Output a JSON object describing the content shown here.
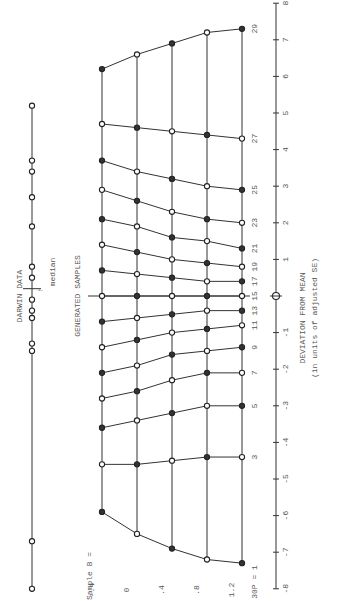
{
  "chart_data": {
    "type": "line",
    "orientation": "rotated-90-clockwise",
    "title_darwin": "DARWIN DATA",
    "title_generated": "GENERATED SAMPLES",
    "median_label": "median",
    "median_arrow": "↑",
    "xlabel_line1": "DEVIATION FROM MEAN",
    "xlabel_line2": "(in units of adjusted SE)",
    "xlim": [
      -8,
      8
    ],
    "x_ticks": [
      "-8",
      "-7",
      "-6",
      "-5",
      "-4",
      "-3",
      "-2",
      "-1",
      "0",
      "1",
      "2",
      "3",
      "4",
      "5",
      "6",
      "7",
      "8"
    ],
    "sample_b_title": "Sample B =",
    "sample_b_values": [
      "-.4",
      "0",
      ".4",
      ".8",
      "1.2"
    ],
    "p_label_prefix": "30P = ",
    "p_values": [
      1,
      3,
      5,
      7,
      9,
      11,
      13,
      15,
      17,
      19,
      21,
      23,
      25,
      27,
      29
    ],
    "darwin_points": [
      -8.0,
      -6.7,
      -1.5,
      -1.3,
      -0.6,
      -0.4,
      -0.1,
      0.5,
      0.8,
      1.9,
      2.7,
      3.4,
      3.7,
      5.2
    ],
    "darwin_median": 0.2,
    "series": [
      {
        "name": "B = -.4",
        "values": [
          -5.9,
          -4.6,
          -3.6,
          -2.8,
          -2.1,
          -1.4,
          -0.7,
          0.0,
          0.7,
          1.4,
          2.1,
          2.9,
          3.7,
          4.7,
          6.2
        ]
      },
      {
        "name": "B = 0",
        "values": [
          -6.5,
          -4.6,
          -3.4,
          -2.6,
          -1.9,
          -1.2,
          -0.6,
          0.0,
          0.6,
          1.2,
          1.9,
          2.6,
          3.4,
          4.6,
          6.6
        ]
      },
      {
        "name": "B = .4",
        "values": [
          -6.9,
          -4.5,
          -3.2,
          -2.3,
          -1.6,
          -1.0,
          -0.5,
          0.0,
          0.5,
          1.0,
          1.6,
          2.3,
          3.2,
          4.5,
          6.9
        ]
      },
      {
        "name": "B = .8",
        "values": [
          -7.2,
          -4.4,
          -3.0,
          -2.1,
          -1.5,
          -0.9,
          -0.4,
          0.0,
          0.4,
          0.9,
          1.5,
          2.1,
          3.0,
          4.4,
          7.2
        ]
      },
      {
        "name": "B = 1.2",
        "values": [
          -7.3,
          -4.4,
          -3.0,
          -2.1,
          -1.4,
          -0.8,
          -0.4,
          0.0,
          0.4,
          0.8,
          1.3,
          2.0,
          2.9,
          4.3,
          7.3
        ]
      }
    ]
  }
}
